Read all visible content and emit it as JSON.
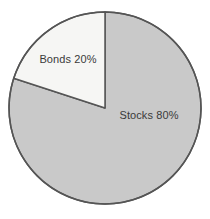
{
  "chart_data": {
    "type": "pie",
    "title": "",
    "subtitle": "",
    "xlabel": "",
    "ylabel": "",
    "legend_position": "none",
    "grid": false,
    "labels_inside": true,
    "start_angle_deg": 0,
    "direction": "clockwise",
    "categories": [
      "Stocks",
      "Bonds"
    ],
    "values": [
      80,
      20
    ],
    "unit": "%",
    "slices": [
      {
        "name": "Stocks",
        "value": 80,
        "label": "Stocks 80%",
        "color": "#c9c9c9",
        "start_deg": 0,
        "end_deg": 288,
        "label_x": 149,
        "label_y": 116
      },
      {
        "name": "Bonds",
        "value": 20,
        "label": "Bonds 20%",
        "color": "#f6f6f4",
        "start_deg": 288,
        "end_deg": 360,
        "label_x": 68,
        "label_y": 60
      }
    ],
    "annotations": []
  },
  "figure": {
    "background_color": "#ffffff",
    "outline_color": "#555555",
    "outline_width": 1.5,
    "text_color": "#3a3a3a",
    "center_x": 105,
    "center_y": 108,
    "radius": 96
  }
}
